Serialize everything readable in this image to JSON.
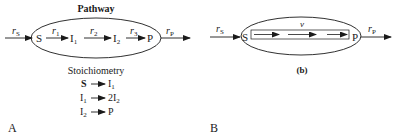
{
  "panel_a": {
    "label": "A",
    "title": "Pathway",
    "input_rate": {
      "main": "r",
      "sub": "S"
    },
    "output_rate": {
      "main": "r",
      "sub": "P"
    },
    "nodes": [
      {
        "main": "S",
        "sub": ""
      },
      {
        "main": "I",
        "sub": "1"
      },
      {
        "main": "I",
        "sub": "2"
      },
      {
        "main": "P",
        "sub": ""
      }
    ],
    "rates": [
      {
        "main": "r",
        "sub": "1"
      },
      {
        "main": "r",
        "sub": "2"
      },
      {
        "main": "r",
        "sub": "3"
      }
    ],
    "stoichiometry_title": "Stoichiometry",
    "stoichiometry": [
      {
        "lhs": "S",
        "lhs_sub": "",
        "rhs": "I",
        "rhs_sub": "1"
      },
      {
        "lhs": "I",
        "lhs_sub": "1",
        "rhs": "2I",
        "rhs_sub": "2"
      },
      {
        "lhs": "I",
        "lhs_sub": "2",
        "rhs": "P",
        "rhs_sub": ""
      }
    ]
  },
  "panel_b": {
    "label": "B",
    "caption": "(b)",
    "input_rate": {
      "main": "r",
      "sub": "S"
    },
    "output_rate": {
      "main": "r",
      "sub": "P"
    },
    "source": "S",
    "sink": "P",
    "flux_label": "v"
  }
}
